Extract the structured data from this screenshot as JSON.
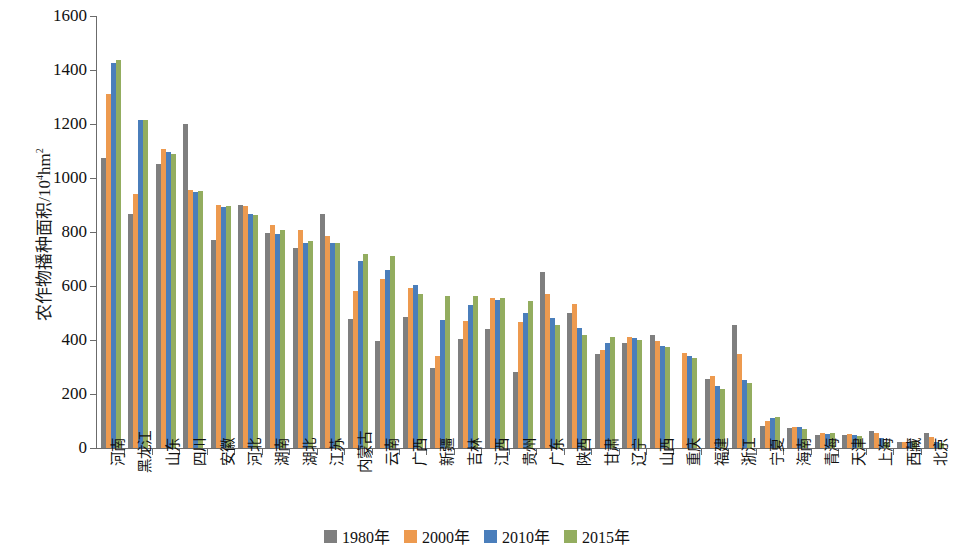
{
  "chart_data": {
    "type": "bar",
    "title": "",
    "xlabel": "",
    "ylabel": "农作物播种面积/10⁴hm²",
    "ylabel_main": "农作物播种面积/10",
    "ylabel_sup": "4",
    "ylabel_tail": "hm",
    "ylabel_sup2": "2",
    "ylim": [
      0,
      1600
    ],
    "ytick_step": 200,
    "yticks": [
      0,
      200,
      400,
      600,
      800,
      1000,
      1200,
      1400,
      1600
    ],
    "grid": false,
    "legend_position": "bottom-center",
    "categories": [
      "河南",
      "黑龙江",
      "山东",
      "四川",
      "安徽",
      "河北",
      "湖南",
      "湖北",
      "江苏",
      "内蒙古",
      "云南",
      "广西",
      "新疆",
      "吉林",
      "江西",
      "贵州",
      "广东",
      "陕西",
      "甘肃",
      "辽宁",
      "山西",
      "重庆",
      "福建",
      "浙江",
      "宁夏",
      "海南",
      "青海",
      "天津",
      "上海",
      "西藏",
      "北京"
    ],
    "series": [
      {
        "name": "1980年",
        "color": "#7f7f7f",
        "values": [
          1075,
          867,
          1053,
          1200,
          770,
          900,
          795,
          742,
          868,
          477,
          398,
          484,
          296,
          403,
          440,
          280,
          652,
          501,
          347,
          389,
          420,
          null,
          257,
          456,
          80,
          74,
          48,
          48,
          63,
          21,
          55
        ]
      },
      {
        "name": "2000年",
        "color": "#ed9a4f",
        "values": [
          1310,
          941,
          1108,
          955,
          900,
          896,
          825,
          806,
          785,
          580,
          626,
          592,
          340,
          472,
          555,
          466,
          572,
          532,
          364,
          411,
          395,
          352,
          266,
          347,
          100,
          78,
          56,
          53,
          55,
          23,
          39
        ]
      },
      {
        "name": "2010年",
        "color": "#4a7ebb",
        "values": [
          1425,
          1215,
          1097,
          950,
          892,
          868,
          793,
          761,
          759,
          694,
          659,
          604,
          473,
          528,
          549,
          499,
          483,
          444,
          389,
          407,
          379,
          339,
          229,
          252,
          110,
          76,
          53,
          48,
          36,
          24,
          24
        ]
      },
      {
        "name": "2015年",
        "color": "#93ad5f",
        "values": [
          1437,
          1216,
          1088,
          953,
          895,
          864,
          809,
          766,
          761,
          718,
          712,
          570,
          562,
          562,
          554,
          545,
          455,
          417,
          413,
          399,
          374,
          334,
          219,
          240,
          116,
          69,
          57,
          45,
          23,
          26,
          20
        ]
      }
    ],
    "legend": [
      {
        "label": "1980年",
        "color": "#7f7f7f"
      },
      {
        "label": "2000年",
        "color": "#ed9a4f"
      },
      {
        "label": "2010年",
        "color": "#4a7ebb"
      },
      {
        "label": "2015年",
        "color": "#93ad5f"
      }
    ]
  }
}
